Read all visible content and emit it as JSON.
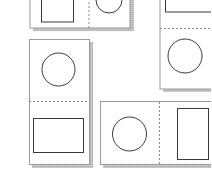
{
  "diagram": {
    "colors": {
      "background": "#ffffff",
      "card_fill": "#ffffff",
      "card_border": "#9a9a9a",
      "shadow": "#b8b8b8",
      "shape_stroke": "#3a3a3a",
      "fold_line": "#8a8a8a"
    },
    "cards": [
      {
        "id": "card-top-left",
        "orientation": "horizontal",
        "panels": [
          "rectangle",
          "circle"
        ],
        "fold": "vertical-dashed"
      },
      {
        "id": "card-top-right",
        "orientation": "vertical",
        "panels": [
          "rectangle",
          "circle"
        ],
        "fold": "horizontal-dashed"
      },
      {
        "id": "card-middle-left",
        "orientation": "vertical",
        "panels": [
          "circle",
          "rectangle"
        ],
        "fold": "horizontal-dashed"
      },
      {
        "id": "card-bottom-right",
        "orientation": "horizontal",
        "panels": [
          "circle",
          "rectangle"
        ],
        "fold": "vertical-dashed"
      }
    ]
  }
}
